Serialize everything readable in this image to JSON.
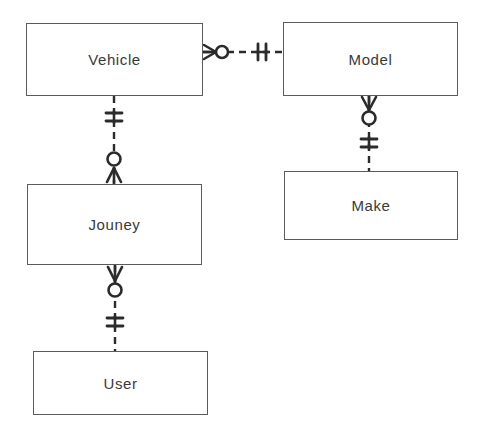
{
  "diagram": {
    "type": "crows-foot-erd",
    "width": 479,
    "height": 445,
    "background_color": "#ffffff",
    "line_color": "#2b2b2b",
    "box_border_color": "#5b5b5b",
    "text_color": "#3a3a3a"
  },
  "entities": [
    {
      "id": "vehicle",
      "label": "Vehicle",
      "x": 26,
      "y": 23,
      "width": 177,
      "height": 73
    },
    {
      "id": "model",
      "label": "Model",
      "x": 283,
      "y": 22,
      "width": 175,
      "height": 74
    },
    {
      "id": "jouney",
      "label": "Jouney",
      "x": 27,
      "y": 184,
      "width": 175,
      "height": 81
    },
    {
      "id": "make",
      "label": "Make",
      "x": 284,
      "y": 171,
      "width": 174,
      "height": 69
    },
    {
      "id": "user",
      "label": "User",
      "x": 33,
      "y": 351,
      "width": 175,
      "height": 64
    }
  ],
  "relationships": [
    {
      "id": "vehicle-model",
      "from": "vehicle",
      "to": "model",
      "orientation": "horizontal",
      "from_cardinality": "zero-or-many",
      "to_cardinality": "one-and-only-one",
      "line_style": "dashed"
    },
    {
      "id": "vehicle-jouney",
      "from": "vehicle",
      "to": "jouney",
      "orientation": "vertical",
      "from_cardinality": "one-and-only-one",
      "to_cardinality": "zero-or-many",
      "line_style": "dashed"
    },
    {
      "id": "model-make",
      "from": "model",
      "to": "make",
      "orientation": "vertical",
      "from_cardinality": "zero-or-many",
      "to_cardinality": "one-and-only-one",
      "line_style": "dashed"
    },
    {
      "id": "jouney-user",
      "from": "jouney",
      "to": "user",
      "orientation": "vertical",
      "from_cardinality": "zero-or-many",
      "to_cardinality": "one-and-only-one",
      "line_style": "dashed"
    }
  ]
}
